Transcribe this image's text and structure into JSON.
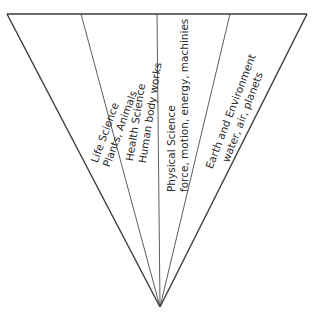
{
  "diagram": {
    "shape": "inverted-triangle",
    "colors": {
      "line": "#3a3a3a",
      "divider": "#4a4a4a",
      "text": "#2a2a2a",
      "background": "#ffffff"
    },
    "sections": [
      {
        "title": "Life Science",
        "subtitle": "Plants, Animals"
      },
      {
        "title": "Health Science",
        "subtitle": "Human body works"
      },
      {
        "title": "Physical Science",
        "subtitle": "force, motion, energy, machinies"
      },
      {
        "title": "Earth and Environment",
        "subtitle": "water, air, planets"
      }
    ]
  }
}
